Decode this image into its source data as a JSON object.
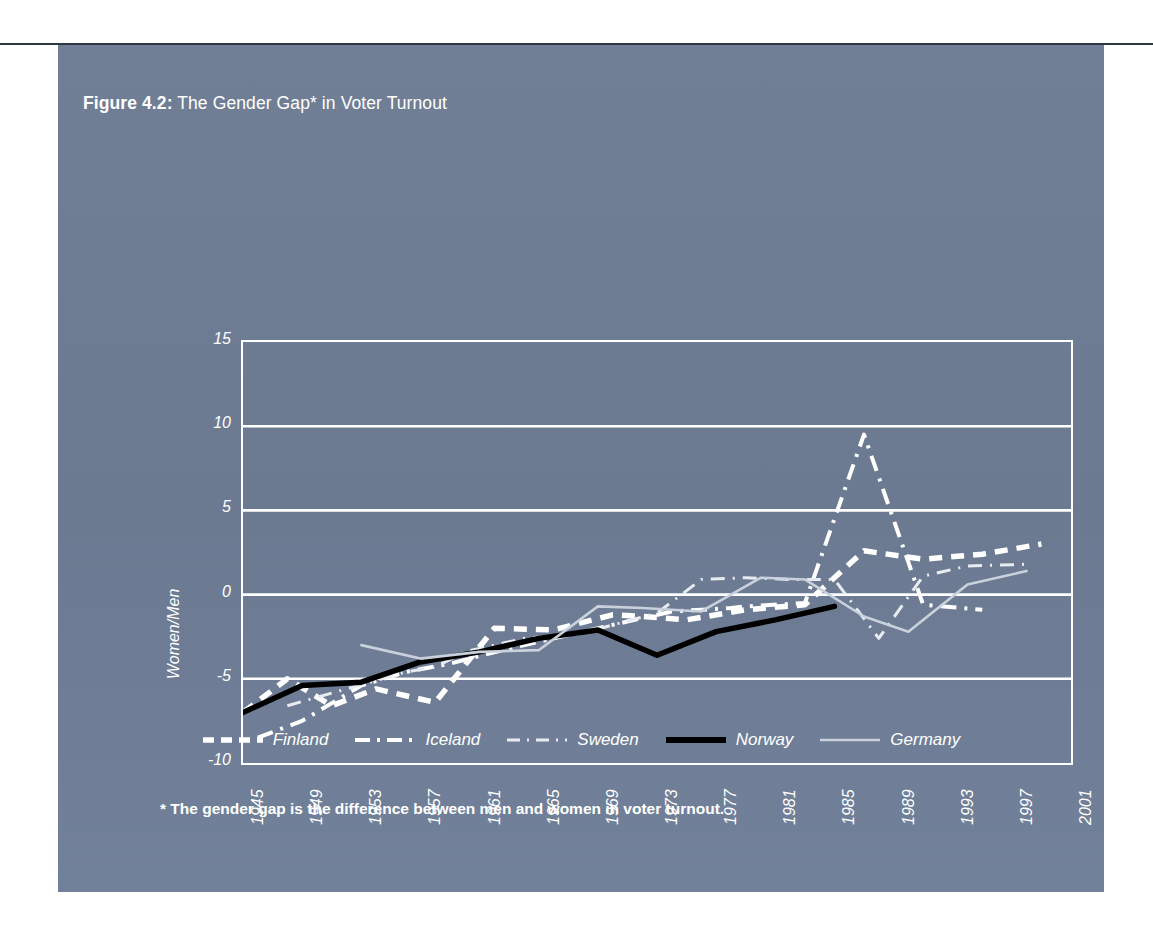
{
  "figure": {
    "number_label": "Figure 4.2:",
    "title_text": "The Gender Gap* in Voter Turnout",
    "footnote": "* The gender gap is the difference between men and women in voter turnout."
  },
  "colors": {
    "panel_background": "#6e7d94",
    "gridline": "#ffffff",
    "axis": "#ffffff",
    "text": "#ffffff",
    "finland": "#ffffff",
    "iceland": "#ffffff",
    "sweden": "#e8ecf2",
    "norway": "#000000",
    "germany": "#c9d2dc",
    "top_rule": "#2e3742"
  },
  "chart_data": {
    "type": "line",
    "title": "The Gender Gap* in Voter Turnout",
    "xlabel": "",
    "ylabel": "Women/Men",
    "xlim": [
      1945,
      2001
    ],
    "ylim": [
      -10,
      15
    ],
    "yticks": [
      15,
      10,
      5,
      0,
      -5,
      -10
    ],
    "ytick_labels": [
      "15",
      "10",
      "5",
      "0",
      "-5",
      "-10"
    ],
    "xticks": [
      1945,
      1949,
      1953,
      1957,
      1961,
      1965,
      1969,
      1973,
      1977,
      1981,
      1985,
      1989,
      1993,
      1997,
      2001
    ],
    "xtick_labels": [
      "1945",
      "1949",
      "1953",
      "1957",
      "1961",
      "1965",
      "1969",
      "1973",
      "1977",
      "1981",
      "1985",
      "1989",
      "1993",
      "1997",
      "2001"
    ],
    "grid": true,
    "grid_axis": "y",
    "legend_position": "below",
    "series": [
      {
        "name": "Finland",
        "style": "thick-dashed",
        "color": "#ffffff",
        "points": [
          [
            1945,
            -7.0
          ],
          [
            1948,
            -5.0
          ],
          [
            1951,
            -6.6
          ],
          [
            1954,
            -5.6
          ],
          [
            1958,
            -6.4
          ],
          [
            1962,
            -2.0
          ],
          [
            1966,
            -2.1
          ],
          [
            1970,
            -1.2
          ],
          [
            1972,
            -1.3
          ],
          [
            1975,
            -1.5
          ],
          [
            1979,
            -0.9
          ],
          [
            1983,
            -0.6
          ],
          [
            1987,
            2.6
          ],
          [
            1991,
            2.1
          ],
          [
            1995,
            2.4
          ],
          [
            1999,
            3.0
          ]
        ]
      },
      {
        "name": "Iceland",
        "style": "dash-dot",
        "color": "#ffffff",
        "points": [
          [
            1946,
            -8.5
          ],
          [
            1949,
            -7.5
          ],
          [
            1953,
            -5.4
          ],
          [
            1956,
            -4.6
          ],
          [
            1959,
            -4.1
          ],
          [
            1963,
            -3.2
          ],
          [
            1967,
            -2.4
          ],
          [
            1971,
            -1.6
          ],
          [
            1974,
            -1.0
          ],
          [
            1978,
            -0.8
          ],
          [
            1979,
            -0.7
          ],
          [
            1983,
            -0.5
          ],
          [
            1987,
            9.5
          ],
          [
            1991,
            -0.6
          ],
          [
            1995,
            -0.9
          ]
        ]
      },
      {
        "name": "Sweden",
        "style": "thin-dash-dot",
        "color": "#e8ecf2",
        "points": [
          [
            1948,
            -6.6
          ],
          [
            1952,
            -5.6
          ],
          [
            1956,
            -4.6
          ],
          [
            1958,
            -4.3
          ],
          [
            1960,
            -3.4
          ],
          [
            1964,
            -2.6
          ],
          [
            1968,
            -2.3
          ],
          [
            1970,
            -1.8
          ],
          [
            1973,
            -1.1
          ],
          [
            1976,
            0.9
          ],
          [
            1979,
            1.0
          ],
          [
            1982,
            0.9
          ],
          [
            1985,
            0.9
          ],
          [
            1988,
            -2.6
          ],
          [
            1991,
            1.1
          ],
          [
            1994,
            1.7
          ],
          [
            1998,
            1.8
          ]
        ]
      },
      {
        "name": "Norway",
        "style": "solid-thick",
        "color": "#000000",
        "points": [
          [
            1945,
            -7.0
          ],
          [
            1949,
            -5.4
          ],
          [
            1953,
            -5.2
          ],
          [
            1957,
            -4.0
          ],
          [
            1961,
            -3.4
          ],
          [
            1965,
            -2.6
          ],
          [
            1969,
            -2.1
          ],
          [
            1973,
            -3.6
          ],
          [
            1977,
            -2.2
          ],
          [
            1981,
            -1.5
          ],
          [
            1985,
            -0.7
          ]
        ]
      },
      {
        "name": "Germany",
        "style": "solid-thin",
        "color": "#c9d2dc",
        "points": [
          [
            1953,
            -3.0
          ],
          [
            1957,
            -3.8
          ],
          [
            1961,
            -3.4
          ],
          [
            1965,
            -3.3
          ],
          [
            1969,
            -0.7
          ],
          [
            1972,
            -0.8
          ],
          [
            1976,
            -1.0
          ],
          [
            1980,
            1.0
          ],
          [
            1983,
            0.9
          ],
          [
            1987,
            -1.3
          ],
          [
            1990,
            -2.2
          ],
          [
            1994,
            0.6
          ],
          [
            1998,
            1.4
          ]
        ]
      }
    ]
  },
  "legend": {
    "items": [
      {
        "label": "Finland",
        "style": "thick-dashed"
      },
      {
        "label": "Iceland",
        "style": "dash-dot"
      },
      {
        "label": "Sweden",
        "style": "thin-dash-dot"
      },
      {
        "label": "Norway",
        "style": "solid-thick"
      },
      {
        "label": "Germany",
        "style": "solid-thin"
      }
    ]
  }
}
